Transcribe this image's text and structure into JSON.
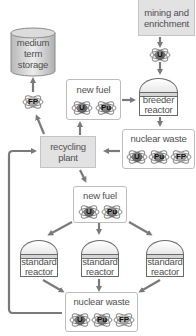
{
  "nodes": {
    "mining": {
      "label": "mining and enrichment"
    },
    "storage": {
      "label": "medium term storage"
    },
    "new_fuel_top": {
      "label": "new fuel",
      "atoms": [
        "U",
        "Pu"
      ]
    },
    "breeder_reactor": {
      "label": "breeder reactor"
    },
    "nuclear_waste_top": {
      "label": "nuclear waste",
      "atoms": [
        "U",
        "Pu",
        "FP"
      ]
    },
    "recycling_plant": {
      "label": "recycling plant"
    },
    "new_fuel_mid": {
      "label": "new fuel",
      "atoms": [
        "U",
        "Pu"
      ]
    },
    "standard_reactor_left": {
      "label": "standard reactor"
    },
    "standard_reactor_center": {
      "label": "standard reactor"
    },
    "standard_reactor_right": {
      "label": "standard reactor"
    },
    "nuclear_waste_bottom": {
      "label": "nuclear waste",
      "atoms": [
        "U",
        "Pu",
        "FP"
      ]
    }
  },
  "flow_atoms": {
    "mining_to_breeder": "U",
    "recycling_to_storage": "FP"
  },
  "colors": {
    "arrow": "#7a7a7a",
    "grey_box": "#e2e2e2",
    "text": "#505050"
  }
}
